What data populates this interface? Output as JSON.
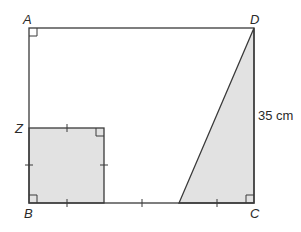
{
  "diagram": {
    "type": "geometry",
    "colors": {
      "stroke": "#3a3a3a",
      "shade": "#e2e2e2",
      "background": "#ffffff"
    },
    "labels": {
      "A": "A",
      "B": "B",
      "C": "C",
      "D": "D",
      "Z": "Z"
    },
    "dimension": "35 cm",
    "shapes": [
      {
        "name": "rectangle ABCD",
        "vertices": [
          "A",
          "B",
          "C",
          "D"
        ]
      },
      {
        "name": "square",
        "vertices": [
          "Z",
          "B"
        ],
        "shaded": true
      },
      {
        "name": "triangle",
        "vertices": [
          "D",
          "C"
        ],
        "shaded": true
      }
    ],
    "tick_marks": "equal-length marks on square sides and on segments of BC",
    "right_angles": [
      "A",
      "B",
      "C",
      "square top-right corner"
    ]
  }
}
